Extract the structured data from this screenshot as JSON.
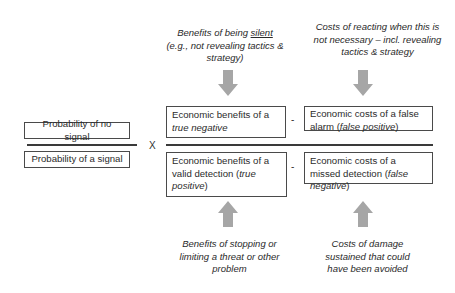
{
  "diagram": {
    "type": "formula-diagram",
    "top_notes": {
      "left": {
        "prefix": "Benefits of being ",
        "underlined": "silent",
        "rest": "(e.g., not revealing tactics & strategy)"
      },
      "right": {
        "line1": "Costs of reacting when this is",
        "line2": "not necessary – incl. revealing",
        "line3": "tactics  & strategy"
      }
    },
    "probability_fraction": {
      "numerator": "Probability of no signal",
      "denominator": "Probability of a signal"
    },
    "operators": {
      "multiply": "X",
      "minus_top": "-",
      "minus_bottom": "-"
    },
    "numerator_terms": {
      "benefit": {
        "text": "Economic benefits of a ",
        "italic": "true negative"
      },
      "cost": {
        "text": "Economic costs of a false alarm (",
        "italic": "false positive",
        "suffix": ")"
      }
    },
    "denominator_terms": {
      "benefit": {
        "text": "Economic benefits of a valid detection (",
        "italic": "true positive",
        "suffix": ")"
      },
      "cost": {
        "text": "Economic costs of a missed detection (",
        "italic": "false negative",
        "suffix": ")"
      }
    },
    "bottom_notes": {
      "left": {
        "line1": "Benefits of stopping or",
        "line2": "limiting a threat or other",
        "line3": "problem"
      },
      "right": {
        "line1": "Costs of damage",
        "line2": "sustained that could",
        "line3": "have been avoided"
      }
    },
    "arrows": [
      {
        "direction": "down",
        "from": "top_notes.left",
        "to": "numerator_terms.benefit"
      },
      {
        "direction": "down",
        "from": "top_notes.right",
        "to": "numerator_terms.cost"
      },
      {
        "direction": "up",
        "from": "bottom_notes.left",
        "to": "denominator_terms.benefit"
      },
      {
        "direction": "up",
        "from": "bottom_notes.right",
        "to": "denominator_terms.cost"
      }
    ],
    "colors": {
      "arrow": "#a6a6a6",
      "line": "#3a3a3a",
      "box_border": "#4a4a4a",
      "text": "#2b2b2b"
    }
  }
}
